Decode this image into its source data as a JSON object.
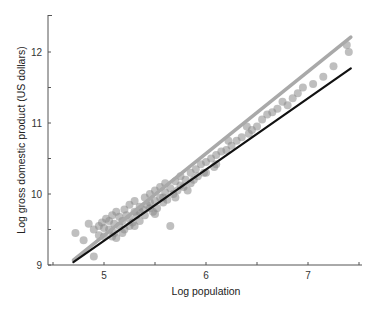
{
  "chart_data": {
    "type": "scatter",
    "title": "",
    "xlabel": "Log population",
    "ylabel": "Log gross domestic product (US dollars)",
    "xlim": [
      4.2,
      7.6
    ],
    "ylim": [
      9,
      12.5
    ],
    "xticks": [
      5,
      6,
      7
    ],
    "xminor": [
      4.5,
      5.5,
      6.5,
      7.5
    ],
    "yticks": [
      9,
      10,
      11,
      12
    ],
    "yminor": [
      9.5,
      10.5,
      11.5
    ],
    "grid": false,
    "legend": null,
    "colors": {
      "points": "#8a8a8a",
      "fit_line": "#a9a9a9",
      "reference_line": "#111111",
      "axis": "#555555"
    },
    "series": [
      {
        "name": "cities",
        "kind": "scatter",
        "points": [
          [
            4.72,
            9.45
          ],
          [
            4.9,
            9.12
          ],
          [
            4.85,
            9.58
          ],
          [
            4.9,
            9.5
          ],
          [
            4.95,
            9.55
          ],
          [
            4.98,
            9.6
          ],
          [
            5.0,
            9.4
          ],
          [
            5.02,
            9.65
          ],
          [
            5.05,
            9.5
          ],
          [
            5.05,
            9.62
          ],
          [
            5.08,
            9.7
          ],
          [
            5.1,
            9.45
          ],
          [
            5.1,
            9.58
          ],
          [
            5.12,
            9.75
          ],
          [
            5.15,
            9.55
          ],
          [
            5.15,
            9.68
          ],
          [
            5.18,
            9.62
          ],
          [
            5.2,
            9.78
          ],
          [
            5.2,
            9.5
          ],
          [
            5.22,
            9.7
          ],
          [
            5.25,
            9.65
          ],
          [
            5.25,
            9.85
          ],
          [
            5.28,
            9.6
          ],
          [
            5.3,
            9.75
          ],
          [
            5.3,
            9.9
          ],
          [
            5.32,
            9.7
          ],
          [
            5.35,
            9.82
          ],
          [
            5.35,
            9.62
          ],
          [
            5.38,
            9.78
          ],
          [
            5.4,
            9.95
          ],
          [
            5.4,
            9.7
          ],
          [
            5.42,
            9.85
          ],
          [
            5.45,
            9.8
          ],
          [
            5.45,
            10.0
          ],
          [
            5.48,
            9.75
          ],
          [
            5.5,
            9.9
          ],
          [
            5.5,
            10.05
          ],
          [
            5.52,
            9.8
          ],
          [
            5.55,
            9.95
          ],
          [
            5.55,
            10.1
          ],
          [
            5.58,
            9.88
          ],
          [
            5.6,
            10.02
          ],
          [
            5.6,
            10.15
          ],
          [
            5.62,
            9.92
          ],
          [
            5.65,
            10.08
          ],
          [
            5.65,
            9.55
          ],
          [
            5.68,
            10.0
          ],
          [
            5.7,
            10.18
          ],
          [
            5.72,
            10.05
          ],
          [
            5.75,
            10.12
          ],
          [
            5.75,
            10.25
          ],
          [
            5.78,
            10.1
          ],
          [
            5.8,
            10.2
          ],
          [
            5.82,
            10.05
          ],
          [
            5.85,
            10.3
          ],
          [
            5.88,
            10.2
          ],
          [
            5.9,
            10.35
          ],
          [
            5.92,
            10.25
          ],
          [
            5.95,
            10.42
          ],
          [
            5.98,
            10.3
          ],
          [
            6.0,
            10.45
          ],
          [
            6.05,
            10.5
          ],
          [
            6.08,
            10.38
          ],
          [
            6.1,
            10.55
          ],
          [
            6.15,
            10.6
          ],
          [
            6.2,
            10.62
          ],
          [
            6.22,
            10.75
          ],
          [
            6.25,
            10.68
          ],
          [
            6.3,
            10.75
          ],
          [
            6.35,
            10.8
          ],
          [
            6.4,
            10.95
          ],
          [
            6.42,
            10.85
          ],
          [
            6.45,
            10.9
          ],
          [
            6.5,
            10.95
          ],
          [
            6.55,
            11.05
          ],
          [
            6.6,
            11.12
          ],
          [
            6.65,
            11.15
          ],
          [
            6.7,
            11.2
          ],
          [
            6.75,
            11.3
          ],
          [
            6.8,
            11.25
          ],
          [
            6.85,
            11.35
          ],
          [
            6.9,
            11.42
          ],
          [
            6.95,
            11.5
          ],
          [
            7.05,
            11.55
          ],
          [
            7.15,
            11.65
          ],
          [
            7.25,
            11.8
          ],
          [
            7.38,
            12.1
          ],
          [
            7.4,
            12.0
          ],
          [
            4.8,
            9.35
          ],
          [
            4.95,
            9.42
          ],
          [
            5.0,
            9.52
          ],
          [
            5.08,
            9.4
          ],
          [
            5.12,
            9.38
          ],
          [
            5.18,
            9.45
          ],
          [
            5.25,
            9.55
          ],
          [
            5.3,
            9.55
          ],
          [
            5.35,
            9.75
          ],
          [
            5.45,
            9.88
          ],
          [
            5.5,
            9.72
          ],
          [
            5.58,
            9.95
          ],
          [
            5.7,
            9.95
          ],
          [
            5.85,
            10.15
          ],
          [
            6.0,
            10.3
          ],
          [
            6.1,
            10.42
          ]
        ]
      },
      {
        "name": "fitted line",
        "kind": "line",
        "x": [
          4.7,
          7.42
        ],
        "y": [
          9.07,
          12.21
        ]
      },
      {
        "name": "linear reference line",
        "kind": "line",
        "x": [
          4.7,
          7.42
        ],
        "y": [
          9.04,
          11.77
        ]
      }
    ]
  }
}
